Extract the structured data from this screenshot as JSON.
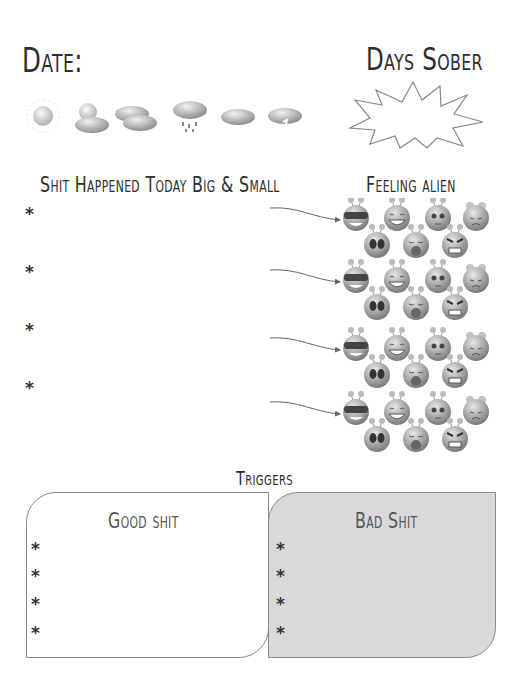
{
  "header": {
    "date_label": "Date:",
    "days_sober_label": "Days Sober"
  },
  "weather": {
    "icons": [
      "sun-icon",
      "partly-cloudy-icon",
      "cloudy-icon",
      "rain-icon",
      "snow-icon",
      "storm-icon"
    ]
  },
  "events": {
    "title": "Shit Happened Today Big & Small",
    "bullets": [
      "*",
      "*",
      "*",
      "*"
    ]
  },
  "feelings": {
    "title": "Feeling alien",
    "alien_faces": [
      "cool-alien",
      "laughing-alien",
      "worried-alien",
      "sad-alien",
      "scared-alien",
      "crying-alien",
      "angry-alien"
    ]
  },
  "triggers": {
    "title": "Triggers",
    "good": {
      "title": "Good shit",
      "bullets": [
        "*",
        "*",
        "*",
        "*",
        "*"
      ]
    },
    "bad": {
      "title": "Bad Shit",
      "bullets": [
        "*",
        "*",
        "*",
        "*",
        "*"
      ]
    },
    "colors": {
      "good_bg": "#ffffff",
      "bad_bg": "#d9d9d9"
    }
  }
}
